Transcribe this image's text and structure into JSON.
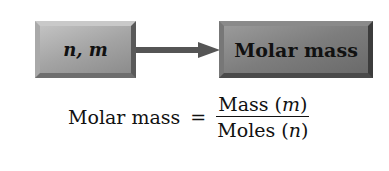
{
  "diagram": {
    "input_box": {
      "label": "n, m"
    },
    "output_box": {
      "label": "Molar mass"
    },
    "arrow": {
      "direction": "right",
      "from": "n, m",
      "to": "Molar mass"
    }
  },
  "formula": {
    "lhs": "Molar mass",
    "operator": "=",
    "numerator": {
      "text": "Mass (",
      "var": "m",
      "close": ")"
    },
    "denominator": {
      "text": "Moles (",
      "var": "n",
      "close": ")"
    }
  },
  "colors": {
    "box_light": "#a4a4a4",
    "box_dark": "#7d7d7d",
    "arrow": "#555555",
    "text": "#111111"
  }
}
